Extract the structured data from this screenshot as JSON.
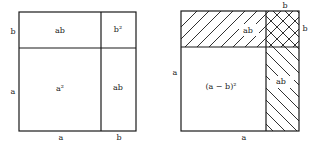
{
  "left_diagram": {
    "regions": {
      "top_left": "ab",
      "top_right": "b²",
      "bottom_left": "a²",
      "bottom_right": "ab"
    },
    "side_labels": {
      "left_top": "b",
      "left_bottom": "a",
      "bottom_left": "a",
      "bottom_right": "b"
    }
  },
  "right_diagram": {
    "regions": {
      "top_strip": "ab",
      "bottom_left": "(a − b)²",
      "right_strip": "ab"
    },
    "side_labels": {
      "top_right": "b",
      "right_top": "b",
      "left": "a",
      "bottom": "a"
    }
  }
}
